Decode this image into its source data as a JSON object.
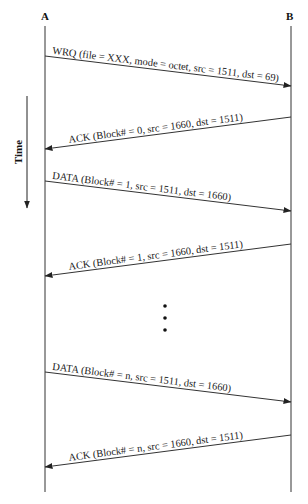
{
  "diagram": {
    "type": "sequence",
    "time_label": "Time",
    "participants": [
      {
        "id": "A",
        "label": "A",
        "x": 45
      },
      {
        "id": "B",
        "label": "B",
        "x": 291
      }
    ],
    "messages": [
      {
        "from": "A",
        "to": "B",
        "y1": 56,
        "y2": 86,
        "label": "WRQ (file = XXX, mode = octet, src = 1511, dst = 69)"
      },
      {
        "from": "B",
        "to": "A",
        "y1": 117,
        "y2": 149,
        "label": "ACK (Block# = 0, src = 1660, dst = 1511)"
      },
      {
        "from": "A",
        "to": "B",
        "y1": 181,
        "y2": 211,
        "label": "DATA (Block# = 1, src = 1511, dst = 1660)"
      },
      {
        "from": "B",
        "to": "A",
        "y1": 244,
        "y2": 276,
        "label": "ACK (Block# = 1, src = 1660, dst = 1511)"
      },
      {
        "from": "A",
        "to": "B",
        "y1": 372,
        "y2": 402,
        "label": "DATA (Block# = n, src = 1511, dst = 1660)"
      },
      {
        "from": "B",
        "to": "A",
        "y1": 435,
        "y2": 467,
        "label": "ACK (Block# = n, src = 1660, dst = 1511)"
      }
    ],
    "ellipsis": {
      "x": 165,
      "ys": [
        306,
        318,
        330
      ]
    },
    "colors": {
      "line": "#333333",
      "text": "#1a1a1a"
    }
  }
}
